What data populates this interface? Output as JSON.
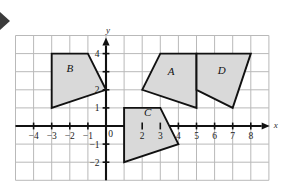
{
  "figure": {
    "background_color": "#ffffff",
    "grid_color": "#b9b9b9",
    "axis_color": "#111111",
    "shape_fill": "#d9d9d9",
    "shape_stroke": "#111111",
    "marker": {
      "name": "left-edge-arrow-marker",
      "color": "#3b3b3b",
      "glyph": "▶"
    }
  },
  "chart_data": {
    "type": "scatter",
    "title": "",
    "xlabel": "x",
    "ylabel": "y",
    "xlim": [
      -5,
      9
    ],
    "ylim": [
      -3,
      5
    ],
    "grid": true,
    "grid_step": 1,
    "legend": "none",
    "x_ticks": [
      -4,
      -3,
      -2,
      -1,
      0,
      2,
      3,
      4,
      5,
      6,
      7,
      8
    ],
    "x_tick_labels": [
      "−4",
      "−3",
      "−2",
      "−1",
      "0",
      "2",
      "3",
      "4",
      "5",
      "6",
      "7",
      "8"
    ],
    "y_ticks": [
      4,
      2,
      1,
      -1,
      -2
    ],
    "y_tick_labels": [
      "4",
      "2",
      "1",
      "−1",
      "−2"
    ],
    "origin_label": "0",
    "shapes": [
      {
        "label": "B",
        "label_point": [
          -2.0,
          3.0
        ],
        "vertices": [
          [
            -3,
            4
          ],
          [
            -1,
            4
          ],
          [
            0,
            2
          ],
          [
            -3,
            1
          ]
        ]
      },
      {
        "label": "A",
        "label_point": [
          3.6,
          2.8
        ],
        "vertices": [
          [
            2,
            2
          ],
          [
            3,
            4
          ],
          [
            5,
            4
          ],
          [
            5,
            1
          ]
        ]
      },
      {
        "label": "D",
        "label_point": [
          6.4,
          2.9
        ],
        "vertices": [
          [
            5,
            4
          ],
          [
            8,
            4
          ],
          [
            7,
            1
          ],
          [
            5,
            2
          ]
        ]
      },
      {
        "label": "C",
        "label_point": [
          2.3,
          0.55
        ],
        "vertices": [
          [
            1,
            1
          ],
          [
            3,
            1
          ],
          [
            4,
            -1
          ],
          [
            1,
            -2
          ]
        ]
      }
    ]
  }
}
